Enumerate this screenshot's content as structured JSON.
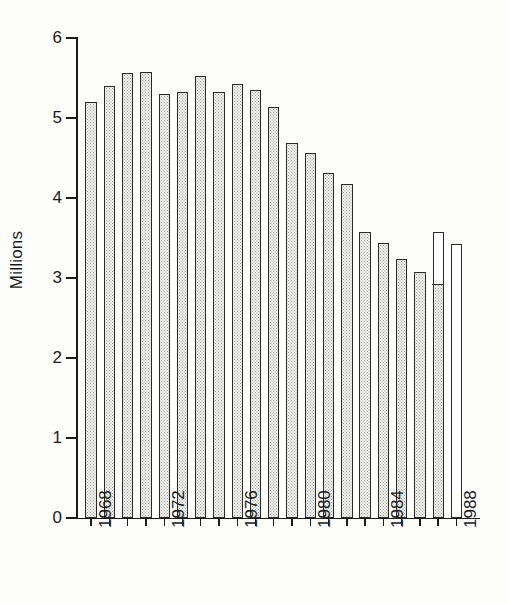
{
  "chart_data": {
    "type": "bar",
    "title": "",
    "subtitle": "",
    "xlabel": "",
    "ylabel": "Millions",
    "ylim": [
      0,
      6
    ],
    "ytick_labels": [
      "0",
      "1",
      "2",
      "3",
      "4",
      "5",
      "6"
    ],
    "ytick_values": [
      0,
      1,
      2,
      3,
      4,
      5,
      6
    ],
    "grid": false,
    "legend": null,
    "categories": [
      "1968",
      "1969",
      "1970",
      "1971",
      "1972",
      "1973",
      "1974",
      "1975",
      "1976",
      "1977",
      "1978",
      "1979",
      "1980",
      "1981",
      "1982",
      "1983",
      "1984",
      "1985",
      "1986",
      "1987",
      "1988"
    ],
    "xtick_labels_shown": [
      "1968",
      "1972",
      "1976",
      "1980",
      "1984",
      "1988"
    ],
    "values": [
      5.2,
      5.4,
      5.56,
      5.58,
      5.3,
      5.33,
      5.53,
      5.33,
      5.43,
      5.35,
      5.14,
      4.69,
      4.56,
      4.31,
      4.18,
      3.58,
      3.44,
      3.24,
      3.07,
      3.58,
      3.42
    ],
    "bar_fill": [
      "shaded",
      "shaded",
      "shaded",
      "shaded",
      "shaded",
      "shaded",
      "shaded",
      "shaded",
      "shaded",
      "shaded",
      "shaded",
      "shaded",
      "shaded",
      "shaded",
      "shaded",
      "shaded",
      "shaded",
      "shaded",
      "shaded",
      "split",
      "unfilled"
    ],
    "annotations": [
      {
        "category": "1987",
        "kind": "segment-divider",
        "value": 2.9,
        "note": "horizontal rule inside 1987 bar at 2.90"
      }
    ],
    "colors": {
      "bar_fill": "#f4f4f2",
      "bar_stipple": "#9a9a96",
      "bar_outline": "#2a2a2a",
      "axis": "#1b1b1b",
      "text": "#1a1a1a",
      "background": "#fdfdfc"
    }
  }
}
